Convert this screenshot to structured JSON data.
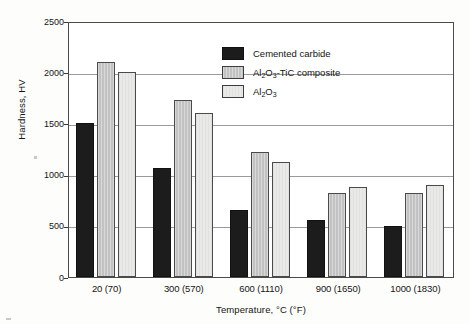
{
  "chart_data": {
    "type": "bar",
    "title": "",
    "xlabel": "Temperature, °C (°F)",
    "ylabel": "Hardness, HV",
    "categories": [
      "20 (70)",
      "300 (570)",
      "600 (1110)",
      "900 (1650)",
      "1000 (1830)"
    ],
    "series": [
      {
        "name": "Cemented carbide",
        "values": [
          1500,
          1060,
          650,
          560,
          500
        ],
        "color": "#1c1c1c"
      },
      {
        "name": "Al2O3-TiC composite",
        "values": [
          2100,
          1730,
          1220,
          820,
          820
        ],
        "color": "#c2c2c2"
      },
      {
        "name": "Al2O3",
        "values": [
          2000,
          1600,
          1120,
          880,
          900
        ],
        "color": "#e9e9e7"
      }
    ],
    "ylim": [
      0,
      2500
    ],
    "yticks": [
      0,
      500,
      1000,
      1500,
      2000,
      2500
    ],
    "ytick_labels": [
      "0",
      "500",
      "1000",
      "1500",
      "2000",
      "2500"
    ],
    "grid": true,
    "legend_position": "top-right"
  },
  "legend": {
    "entries": [
      {
        "label": "Cemented carbide",
        "html": "Cemented carbide"
      },
      {
        "label": "Al2O3-TiC composite",
        "html": "Al<sub>2</sub>O<sub>3</sub>-TiC composite"
      },
      {
        "label": "Al2O3",
        "html": "Al<sub>2</sub>O<sub>3</sub>"
      }
    ]
  },
  "axes": {
    "y_title": "Hardness, HV",
    "x_title": "Temperature, °C (°F)"
  }
}
